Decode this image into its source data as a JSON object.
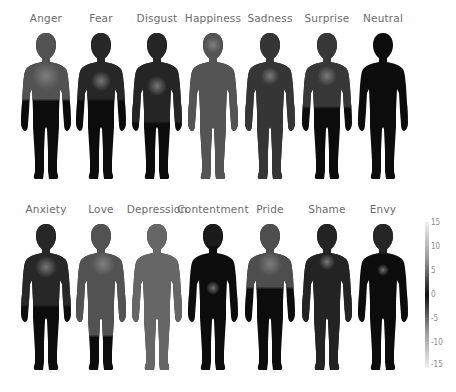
{
  "rows": [
    {
      "emotions": [
        {
          "label": "Anger",
          "x": 18,
          "y": 12
        },
        {
          "label": "Fear",
          "x": 73,
          "y": 12
        },
        {
          "label": "Disgust",
          "x": 129,
          "y": 12
        },
        {
          "label": "Happiness",
          "x": 185,
          "y": 12
        },
        {
          "label": "Sadness",
          "x": 242,
          "y": 12
        },
        {
          "label": "Surprise",
          "x": 299,
          "y": 12
        },
        {
          "label": "Neutral",
          "x": 355,
          "y": 12
        }
      ]
    },
    {
      "emotions": [
        {
          "label": "Anxiety",
          "x": 18,
          "y": 203
        },
        {
          "label": "Love",
          "x": 73,
          "y": 203
        },
        {
          "label": "Depression",
          "x": 129,
          "y": 203
        },
        {
          "label": "Contentment",
          "x": 185,
          "y": 203
        },
        {
          "label": "Pride",
          "x": 242,
          "y": 203
        },
        {
          "label": "Shame",
          "x": 299,
          "y": 203
        },
        {
          "label": "Envy",
          "x": 355,
          "y": 203
        }
      ]
    }
  ],
  "colorbar": {
    "ticks": [
      "15",
      "10",
      "5",
      "0",
      "-5",
      "-10",
      "-15"
    ],
    "max": 15,
    "min": -15
  }
}
